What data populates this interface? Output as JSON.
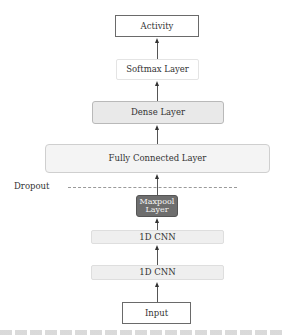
{
  "diagram": {
    "title": "",
    "nodes": [
      {
        "id": "activity",
        "label": "Activity"
      },
      {
        "id": "softmax",
        "label": "Softmax Layer"
      },
      {
        "id": "dense",
        "label": "Dense Layer"
      },
      {
        "id": "fully_connected",
        "label": "Fully Connected Layer"
      },
      {
        "id": "maxpool",
        "label_line1": "Maxpool",
        "label_line2": "Layer"
      },
      {
        "id": "cnn2",
        "label": "1D CNN"
      },
      {
        "id": "cnn1",
        "label": "1D CNN"
      },
      {
        "id": "input",
        "label": "Input"
      }
    ],
    "edges": [
      {
        "from": "input",
        "to": "cnn1"
      },
      {
        "from": "cnn1",
        "to": "cnn2"
      },
      {
        "from": "cnn2",
        "to": "maxpool"
      },
      {
        "from": "maxpool",
        "to": "fully_connected"
      },
      {
        "from": "fully_connected",
        "to": "dense"
      },
      {
        "from": "dense",
        "to": "softmax"
      },
      {
        "from": "softmax",
        "to": "activity"
      }
    ],
    "annotations": {
      "dropout_label": "Dropout"
    },
    "colors": {
      "outline_box": "#ffffff",
      "dense_fill": "#e9e9e9",
      "fully_connected_fill": "#f4f4f4",
      "maxpool_fill": "#6e6e6e",
      "cnn_fill": "#efefef",
      "arrow": "#333333"
    }
  }
}
